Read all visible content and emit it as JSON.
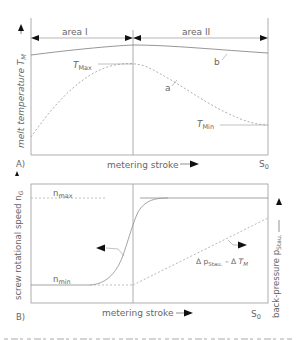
{
  "panel_a": {
    "tag": "A)",
    "y_label": "melt temperature T",
    "y_label_sub": "M",
    "x_label": "metering stroke",
    "end_label": "S",
    "end_label_sub": "0",
    "area_1": "area I",
    "area_2": "area II",
    "t_max": "T",
    "t_max_sub": "Max",
    "t_min": "T",
    "t_min_sub": "Min",
    "curve_a": "a",
    "curve_b": "b"
  },
  "panel_b": {
    "tag": "B)",
    "y_label_left": "screw rotational speed n",
    "y_label_left_sub": "G",
    "y_label_right": "back-pressure p",
    "y_label_right_sub": "Stau.",
    "x_label": "metering stroke",
    "end_label": "S",
    "end_label_sub": "0",
    "n_max": "n",
    "n_max_sub": "max",
    "n_min": "n",
    "n_min_sub": "min",
    "relation_p": "Δ p",
    "relation_p_sub": "Stau.",
    "relation_mid": " – Δ ",
    "relation_t": "T",
    "relation_t_sub": "M"
  },
  "colors": {
    "line": "#8a8a8a",
    "dashed": "#b0b0b0",
    "text": "#666666",
    "arrow": "#111111"
  }
}
